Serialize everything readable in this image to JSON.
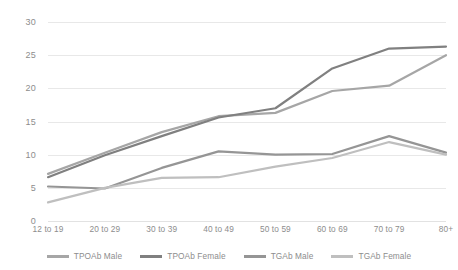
{
  "chart_data": {
    "type": "line",
    "title": "",
    "xlabel": "",
    "ylabel": "",
    "categories": [
      "12 to 19",
      "20 to 29",
      "30 to 39",
      "40 to 49",
      "50 to 59",
      "60 to 69",
      "70 to 79",
      "80+"
    ],
    "ylim": [
      0,
      30
    ],
    "yticks": [
      0,
      5,
      10,
      15,
      20,
      25,
      30
    ],
    "ytick_labels": [
      "0",
      "5",
      "10",
      "15",
      "20",
      "25",
      "30"
    ],
    "grid": true,
    "legend_position": "bottom",
    "series": [
      {
        "name": "TPOAb Male",
        "color": "#a6a6a6",
        "values": [
          7.1,
          10.3,
          13.4,
          15.8,
          16.3,
          19.6,
          20.4,
          25.0
        ]
      },
      {
        "name": "TPOAb Female",
        "color": "#808080",
        "values": [
          6.6,
          9.9,
          12.8,
          15.6,
          17.0,
          23.0,
          26.0,
          26.3
        ]
      },
      {
        "name": "TGAb Male",
        "color": "#959595",
        "values": [
          5.2,
          4.9,
          8.0,
          10.5,
          10.0,
          10.1,
          12.8,
          10.3
        ]
      },
      {
        "name": "TGAb Female",
        "color": "#bfbfbf",
        "values": [
          2.8,
          5.0,
          6.5,
          6.6,
          8.2,
          9.5,
          11.9,
          10.0
        ]
      }
    ]
  },
  "legend": {
    "items": [
      {
        "label": "TPOAb Male"
      },
      {
        "label": "TPOAb Female"
      },
      {
        "label": "TGAb Male"
      },
      {
        "label": "TGAb Female"
      }
    ]
  }
}
